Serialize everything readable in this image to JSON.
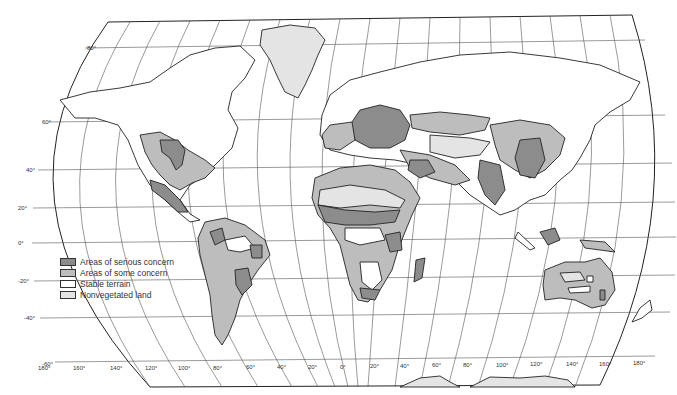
{
  "map": {
    "title": "World desertification map",
    "colors": {
      "serious": "#8c8c8c",
      "some": "#bdbdbd",
      "stable": "#ffffff",
      "nonvegetated": "#e4e4e4",
      "outline": "#222222",
      "grid": "#555555"
    },
    "latitude_labels": [
      "80°",
      "60°",
      "40°",
      "20°",
      "0°",
      "-20°",
      "-40°",
      "-60°"
    ],
    "longitude_labels": [
      "180°",
      "160°",
      "140°",
      "120°",
      "100°",
      "80°",
      "60°",
      "40°",
      "20°",
      "0°",
      "20°",
      "40°",
      "60°",
      "80°",
      "100°",
      "120°",
      "140°",
      "160°",
      "180°"
    ]
  },
  "legend": {
    "items": [
      {
        "label": "Areas of serious concern",
        "color": "#8c8c8c"
      },
      {
        "label": "Areas of some concern",
        "color": "#bdbdbd"
      },
      {
        "label": "Stable terrain",
        "color": "#ffffff"
      },
      {
        "label": "Nonvegetated land",
        "color": "#e4e4e4"
      }
    ]
  }
}
